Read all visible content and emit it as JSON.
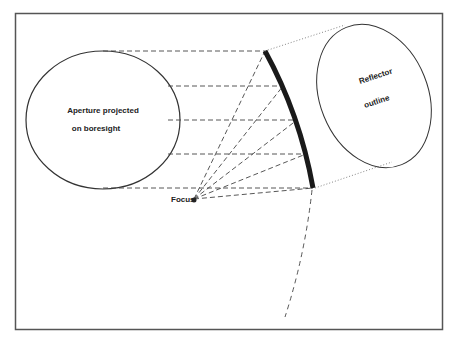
{
  "diagram": {
    "type": "reflector-antenna-geometry",
    "labels": {
      "aperture_line1": "Aperture projected",
      "aperture_line2": "on boresight",
      "reflector_line1": "Reflector",
      "reflector_line2": "outline",
      "focus": "Focus"
    },
    "colors": {
      "line": "#333333",
      "reflector": "#1a1a1a",
      "frame": "#555555",
      "background": "#ffffff"
    }
  }
}
